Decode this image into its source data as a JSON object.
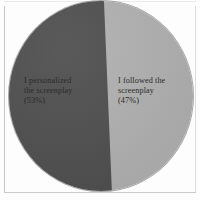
{
  "chart_data": {
    "type": "pie",
    "title": "",
    "labels": [
      "I personalized the screenplay",
      "I followed the screenplay"
    ],
    "values": [
      53,
      47
    ],
    "value_unit": "%",
    "slice_colors": [
      "#515151",
      "#b2b2b2"
    ],
    "legend": "none",
    "annotations": [
      "I personalized the screenplay (53%)",
      "I followed the screenplay (47%)"
    ]
  },
  "chart": {
    "slices": [
      {
        "name": "personalized",
        "label_line1": "I personalized",
        "label_line2": "the screenplay",
        "label_line3": "(53%)",
        "percent": 53,
        "color": "#515151"
      },
      {
        "name": "followed",
        "label_line1": "I followed the",
        "label_line2": "screenplay",
        "label_line3": "(47%)",
        "percent": 47,
        "color": "#b2b2b2"
      }
    ],
    "label_left_text": "I personalized\nthe screenplay\n(53%)",
    "label_right_text": "I followed the\nscreenplay\n(47%)"
  }
}
